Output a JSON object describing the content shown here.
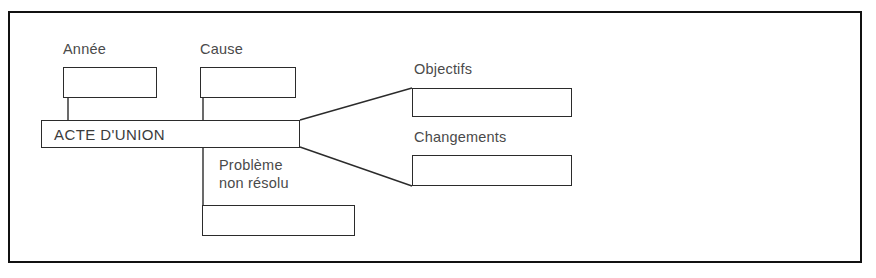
{
  "diagram": {
    "title": "ACTE D'UNION",
    "center_node": {
      "label": "ACTE D'UNION"
    },
    "branches": [
      {
        "key": "annee",
        "label": "Année",
        "value": "",
        "position": "top-left"
      },
      {
        "key": "cause",
        "label": "Cause",
        "value": "",
        "position": "top-middle"
      },
      {
        "key": "probleme",
        "label": "Problème\nnon résolu",
        "label_line1": "Problème",
        "label_line2": "non résolu",
        "value": "",
        "position": "bottom-middle"
      },
      {
        "key": "objectifs",
        "label": "Objectifs",
        "value": "",
        "position": "right-top"
      },
      {
        "key": "changements",
        "label": "Changements",
        "value": "",
        "position": "right-bottom"
      }
    ],
    "colors": {
      "frame": "#111111",
      "box_border": "#2b2b2b",
      "label_text": "#4a4a4a",
      "center_text": "#3c3c3c",
      "background": "#ffffff"
    }
  }
}
